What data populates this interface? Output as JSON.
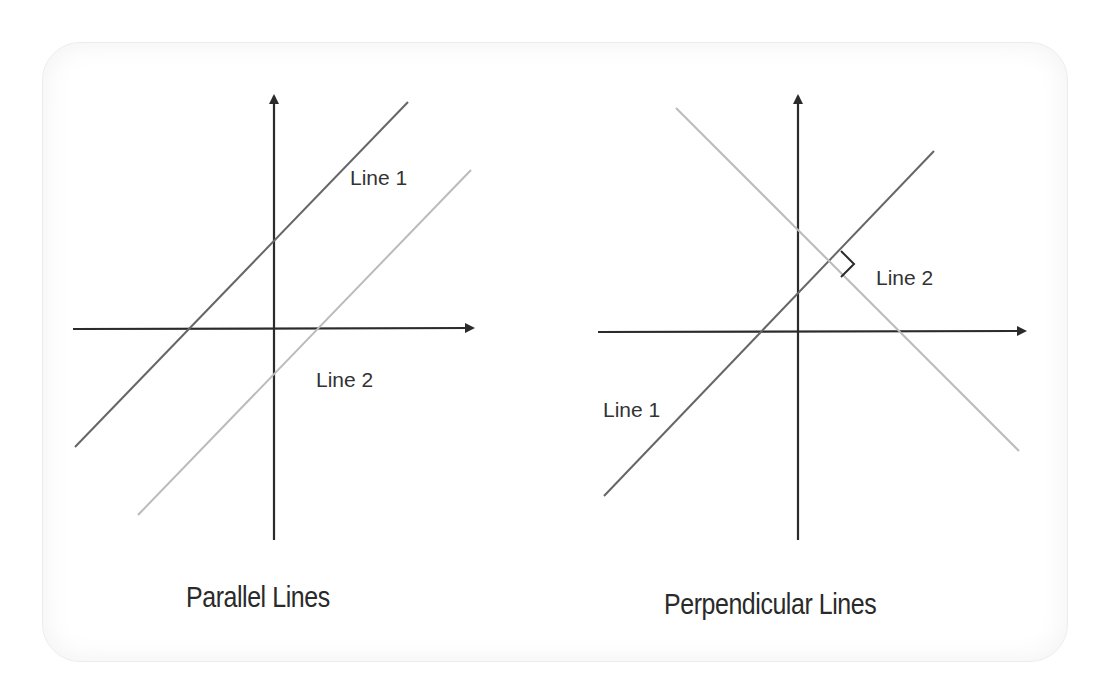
{
  "panels": [
    {
      "title": "Parallel Lines",
      "labels": {
        "line1": "Line 1",
        "line2": "Line 2"
      },
      "axes": {
        "x_origin": [
          73,
          329
        ],
        "x_end": [
          475,
          329
        ],
        "y_origin": [
          274,
          540
        ],
        "y_end": [
          274,
          92
        ]
      },
      "lines": [
        {
          "name": "Line 1",
          "from": [
            75,
            447
          ],
          "to": [
            408,
            102
          ],
          "color": "#666666"
        },
        {
          "name": "Line 2",
          "from": [
            138,
            515
          ],
          "to": [
            471,
            170
          ],
          "color": "#bbbbbb"
        }
      ]
    },
    {
      "title": "Perpendicular Lines",
      "labels": {
        "line1": "Line 1",
        "line2": "Line 2"
      },
      "axes": {
        "x_origin": [
          598,
          332
        ],
        "x_end": [
          1027,
          332
        ],
        "y_origin": [
          798,
          540
        ],
        "y_end": [
          798,
          92
        ]
      },
      "lines": [
        {
          "name": "Line 1",
          "from": [
            604,
            496
          ],
          "to": [
            934,
            151
          ],
          "color": "#666666"
        },
        {
          "name": "Line 2",
          "from": [
            676,
            108
          ],
          "to": [
            1019,
            451
          ],
          "color": "#bbbbbb"
        }
      ],
      "right_angle_marker": true
    }
  ],
  "colors": {
    "axis": "#2b2b2b",
    "line_dark": "#666666",
    "line_light": "#bbbbbb",
    "text": "#2a2a2a"
  }
}
